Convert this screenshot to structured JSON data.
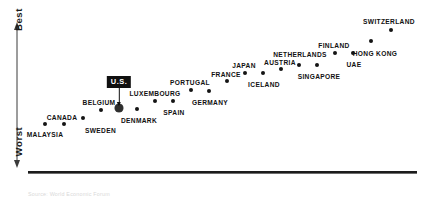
{
  "chart_data": {
    "type": "scatter",
    "title": "",
    "subtitle": "",
    "xlabel": "",
    "ylabel": "Best to Worst",
    "grid": false,
    "legend": null,
    "axis": {
      "y_top_label": "Best",
      "y_bottom_label": "Worst",
      "y_arrow": "double-headed vertical arrow",
      "x_axis_line": true,
      "x_tick_labels": []
    },
    "note": "Rank-ordered scatter of countries; y position encodes relative score (higher = better). No numeric tick labels are printed on either axis.",
    "categories": [
      "MALAYSIA",
      "CANADA",
      "SWEDEN",
      "BELGIUM",
      "U.S.",
      "DENMARK",
      "LUXEMBOURG",
      "SPAIN",
      "PORTUGAL",
      "GERMANY",
      "FRANCE",
      "JAPAN",
      "ICELAND",
      "AUSTRIA",
      "NETHERLANDS",
      "SINGAPORE",
      "FINLAND",
      "UAE",
      "HONG KONG",
      "SWITZERLAND"
    ],
    "points": [
      {
        "label": "MALAYSIA",
        "x": 45,
        "y": 124,
        "label_x": 45,
        "label_y": 132,
        "align": "c",
        "highlight": false
      },
      {
        "label": "CANADA",
        "x": 64,
        "y": 124,
        "label_x": 62,
        "label_y": 115,
        "align": "c",
        "highlight": false
      },
      {
        "label": "SWEDEN",
        "x": 83,
        "y": 118,
        "label_x": 85,
        "label_y": 128,
        "align": "l",
        "highlight": false
      },
      {
        "label": "BELGIUM",
        "x": 101,
        "y": 110,
        "label_x": 99,
        "label_y": 100,
        "align": "c",
        "highlight": false
      },
      {
        "label": "U.S.",
        "x": 119,
        "y": 108,
        "label_x": 119,
        "label_y": 76,
        "align": "c",
        "highlight": true
      },
      {
        "label": "DENMARK",
        "x": 137,
        "y": 109,
        "label_x": 139,
        "label_y": 118,
        "align": "c",
        "highlight": false
      },
      {
        "label": "LUXEMBOURG",
        "x": 155,
        "y": 101,
        "label_x": 155,
        "label_y": 91,
        "align": "c",
        "highlight": false
      },
      {
        "label": "SPAIN",
        "x": 173,
        "y": 101,
        "label_x": 174,
        "label_y": 110,
        "align": "c",
        "highlight": false
      },
      {
        "label": "PORTUGAL",
        "x": 191,
        "y": 90,
        "label_x": 190,
        "label_y": 80,
        "align": "c",
        "highlight": false
      },
      {
        "label": "GERMANY",
        "x": 209,
        "y": 91,
        "label_x": 210,
        "label_y": 100,
        "align": "c",
        "highlight": false
      },
      {
        "label": "FRANCE",
        "x": 227,
        "y": 81,
        "label_x": 226,
        "label_y": 72,
        "align": "c",
        "highlight": false
      },
      {
        "label": "JAPAN",
        "x": 245,
        "y": 73,
        "label_x": 244,
        "label_y": 63,
        "align": "c",
        "highlight": false
      },
      {
        "label": "ICELAND",
        "x": 263,
        "y": 73,
        "label_x": 264,
        "label_y": 82,
        "align": "c",
        "highlight": false
      },
      {
        "label": "AUSTRIA",
        "x": 281,
        "y": 69,
        "label_x": 280,
        "label_y": 60,
        "align": "c",
        "highlight": false
      },
      {
        "label": "NETHERLANDS",
        "x": 299,
        "y": 65,
        "label_x": 300,
        "label_y": 52,
        "align": "c",
        "highlight": false
      },
      {
        "label": "SINGAPORE",
        "x": 317,
        "y": 65,
        "label_x": 319,
        "label_y": 74,
        "align": "c",
        "highlight": false
      },
      {
        "label": "FINLAND",
        "x": 335,
        "y": 53,
        "label_x": 334,
        "label_y": 43,
        "align": "c",
        "highlight": false
      },
      {
        "label": "UAE",
        "x": 353,
        "y": 53,
        "label_x": 354,
        "label_y": 62,
        "align": "c",
        "highlight": false
      },
      {
        "label": "HONG KONG",
        "x": 371,
        "y": 41,
        "label_x": 375,
        "label_y": 51,
        "align": "c",
        "highlight": false
      },
      {
        "label": "SWITZERLAND",
        "x": 391,
        "y": 30,
        "label_x": 389,
        "label_y": 19,
        "align": "c",
        "highlight": false
      }
    ],
    "highlighted_point": "U.S.",
    "colors": {
      "point": "#141414",
      "highlight_point": "#2e2e2e",
      "callout_background": "#101010",
      "callout_text": "#ffffff",
      "axis": "#1c1c1c",
      "label_text": "#111111"
    }
  },
  "callout": {
    "label": "U.S."
  },
  "footnote": {
    "text": "Source: World Economic Forum"
  }
}
